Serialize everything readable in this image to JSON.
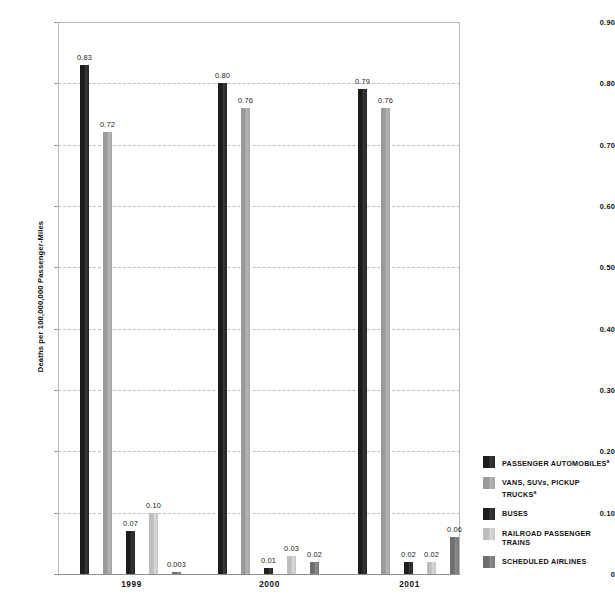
{
  "chart_data": {
    "type": "bar",
    "title": "",
    "subtitle": "",
    "xlabel": "",
    "ylabel": "Deaths per 100,000,000 Passenger-Miles",
    "categories": [
      "1999",
      "2000",
      "2001"
    ],
    "ylim": [
      0,
      0.9
    ],
    "ytick_labels": [
      "0.90",
      "0.80",
      "0.70",
      "0.60",
      "0.50",
      "0.40",
      "0.30",
      "0.20",
      "0.10",
      "0"
    ],
    "ytick_values": [
      0.9,
      0.8,
      0.7,
      0.6,
      0.5,
      0.4,
      0.3,
      0.2,
      0.1,
      0
    ],
    "grid": "horizontal-dashed",
    "legend_position": "right",
    "series": [
      {
        "name": "PASSENGER AUTOMOBILES",
        "footnote": "a",
        "color": "#1c1c1c",
        "values": [
          0.83,
          0.8,
          0.79
        ],
        "labels": [
          "0.83",
          "0.80",
          "0.79"
        ]
      },
      {
        "name": "VANS, SUVs, PICKUP TRUCKS",
        "footnote": "a",
        "color": "#9a9a9a",
        "values": [
          0.72,
          0.76,
          0.76
        ],
        "labels": [
          "0.72",
          "0.76",
          "0.76"
        ]
      },
      {
        "name": "BUSES",
        "footnote": "",
        "color": "#1c1c1c",
        "values": [
          0.07,
          0.01,
          0.02
        ],
        "labels": [
          "0.07",
          "0.01",
          "0.02"
        ]
      },
      {
        "name": "RAILROAD PASSENGER TRAINS",
        "footnote": "",
        "color": "#bdbdbd",
        "values": [
          0.1,
          0.03,
          0.02
        ],
        "labels": [
          "0.10",
          "0.03",
          "0.02"
        ]
      },
      {
        "name": "SCHEDULED AIRLINES",
        "footnote": "",
        "color": "#6e6e6e",
        "values": [
          0.003,
          0.02,
          0.06
        ],
        "labels": [
          "0.003",
          "0.02",
          "0.06"
        ]
      }
    ]
  },
  "axis": {
    "y_title": "Deaths per 100,000,000 Passenger-Miles",
    "ticks": [
      {
        "label": "0.90"
      },
      {
        "label": "0.80"
      },
      {
        "label": "0.70"
      },
      {
        "label": "0.60"
      },
      {
        "label": "0.50"
      },
      {
        "label": "0.40"
      },
      {
        "label": "0.30"
      },
      {
        "label": "0.20"
      },
      {
        "label": "0.10"
      },
      {
        "label": "0"
      }
    ],
    "x_groups": [
      {
        "label": "1999"
      },
      {
        "label": "2000"
      },
      {
        "label": "2001"
      }
    ]
  },
  "legend": {
    "items": [
      {
        "label": "PASSENGER AUTOMOBILES",
        "footnote": "a",
        "color": "#1c1c1c"
      },
      {
        "label": "VANS, SUVs, PICKUP TRUCKS",
        "footnote": "a",
        "color": "#9a9a9a"
      },
      {
        "label": "BUSES",
        "footnote": "",
        "color": "#1c1c1c"
      },
      {
        "label": "RAILROAD PASSENGER TRAINS",
        "footnote": "",
        "color": "#bdbdbd"
      },
      {
        "label": "SCHEDULED AIRLINES",
        "footnote": "",
        "color": "#6e6e6e"
      }
    ]
  }
}
